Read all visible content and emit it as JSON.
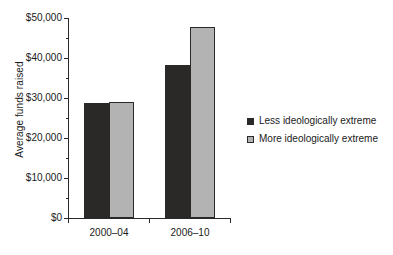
{
  "chart_data": {
    "type": "bar",
    "title": "",
    "xlabel": "",
    "ylabel": "Average funds raised",
    "categories": [
      "2000–04",
      "2006–10"
    ],
    "series": [
      {
        "name": "Less ideologically extreme",
        "color": "#2b2828",
        "values": [
          28800,
          38300
        ]
      },
      {
        "name": "More ideologically extreme",
        "color": "#b3b3b3",
        "values": [
          29000,
          47800
        ]
      }
    ],
    "ylim": [
      0,
      50000
    ],
    "y_major_ticks": [
      0,
      10000,
      20000,
      30000,
      40000,
      50000
    ],
    "y_minor_ticks": [
      5000,
      15000,
      25000,
      35000,
      45000
    ],
    "y_tick_labels": [
      "$0",
      "$10,000",
      "$20,000",
      "$30,000",
      "$40,000",
      "$50,000"
    ],
    "grid": false,
    "legend_position": "right",
    "axis_color": "#2b2828",
    "background_color": "#ffffff"
  },
  "legend": {
    "entries": [
      {
        "label": "Less ideologically extreme",
        "color": "#2b2828"
      },
      {
        "label": "More ideologically extreme",
        "color": "#b3b3b3"
      }
    ]
  }
}
